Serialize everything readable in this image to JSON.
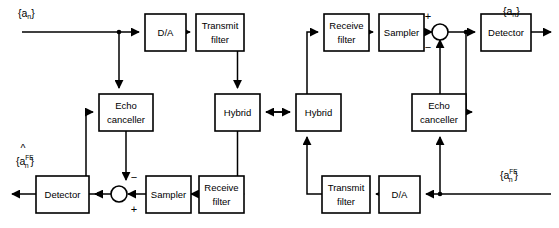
{
  "diagram": {
    "type": "block-diagram",
    "background_color": "#ffffff",
    "line_color": "#000000",
    "blocks": [
      {
        "id": "da_left",
        "label": "D/A",
        "x": 145,
        "y": 14,
        "w": 41,
        "h": 37
      },
      {
        "id": "txfilter_left",
        "label": "Transmit\nfilter",
        "x": 196,
        "y": 14,
        "w": 48,
        "h": 37
      },
      {
        "id": "echo_left",
        "label": "Echo\ncanceller",
        "x": 99,
        "y": 94,
        "w": 54,
        "h": 37
      },
      {
        "id": "hybrid_left",
        "label": "Hybrid",
        "x": 215,
        "y": 94,
        "w": 45,
        "h": 37
      },
      {
        "id": "detector_left",
        "label": "Detector",
        "x": 36,
        "y": 176,
        "w": 53,
        "h": 37
      },
      {
        "id": "sampler_left",
        "label": "Sampler",
        "x": 146,
        "y": 176,
        "w": 45,
        "h": 37
      },
      {
        "id": "rxfilter_left",
        "label": "Receive\nfilter",
        "x": 199,
        "y": 176,
        "w": 45,
        "h": 37
      },
      {
        "id": "hybrid_right",
        "label": "Hybrid",
        "x": 296,
        "y": 94,
        "w": 45,
        "h": 37
      },
      {
        "id": "rxfilter_right",
        "label": "Receive\nfilter",
        "x": 324,
        "y": 14,
        "w": 45,
        "h": 37
      },
      {
        "id": "sampler_right",
        "label": "Sampler",
        "x": 379,
        "y": 14,
        "w": 45,
        "h": 37
      },
      {
        "id": "detector_right",
        "label": "Detector",
        "x": 481,
        "y": 14,
        "w": 50,
        "h": 37
      },
      {
        "id": "echo_right",
        "label": "Echo\ncanceller",
        "x": 412,
        "y": 94,
        "w": 54,
        "h": 37
      },
      {
        "id": "txfilter_right",
        "label": "Transmit\nfilter",
        "x": 322,
        "y": 176,
        "w": 48,
        "h": 37
      },
      {
        "id": "da_right",
        "label": "D/A",
        "x": 379,
        "y": 176,
        "w": 41,
        "h": 37
      }
    ],
    "summers": [
      {
        "id": "summer_left",
        "cx": 119,
        "cy": 194,
        "r": 8,
        "signs": [
          {
            "label": "−",
            "x": 133,
            "y": 178
          },
          {
            "label": "+",
            "x": 133,
            "y": 210
          }
        ]
      },
      {
        "id": "summer_right",
        "cx": 440,
        "cy": 32,
        "r": 8,
        "signs": [
          {
            "label": "+",
            "x": 428,
            "y": 18
          },
          {
            "label": "−",
            "x": 428,
            "y": 47
          }
        ]
      }
    ],
    "signals": [
      {
        "id": "input_near",
        "base": "a",
        "hat": false,
        "sub": "n",
        "sup": "",
        "x": 18,
        "y": 14
      },
      {
        "id": "output_far",
        "base": "a",
        "hat": true,
        "sub": "n",
        "sup": "FE",
        "x": 16,
        "y": 160
      },
      {
        "id": "output_near",
        "base": "a",
        "hat": true,
        "sub": "n",
        "sup": "",
        "x": 505,
        "y": 10
      },
      {
        "id": "input_far",
        "base": "a",
        "hat": false,
        "sub": "n",
        "sup": "FE",
        "x": 500,
        "y": 176
      }
    ]
  }
}
